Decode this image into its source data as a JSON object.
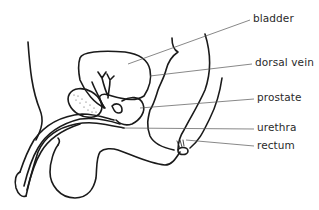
{
  "diagram": {
    "type": "anatomical-line-drawing",
    "labels": [
      {
        "id": "bladder",
        "text": "bladder",
        "x": 253,
        "y": 13
      },
      {
        "id": "dorsal-vein",
        "text": "dorsal vein",
        "x": 255,
        "y": 57
      },
      {
        "id": "prostate",
        "text": "prostate",
        "x": 257,
        "y": 92
      },
      {
        "id": "urethra",
        "text": "urethra",
        "x": 257,
        "y": 122
      },
      {
        "id": "rectum",
        "text": "rectum",
        "x": 257,
        "y": 140
      }
    ],
    "colors": {
      "line": "#1a1a1a",
      "leader": "#555555",
      "text": "#2a2a2a",
      "background": "#ffffff"
    }
  }
}
